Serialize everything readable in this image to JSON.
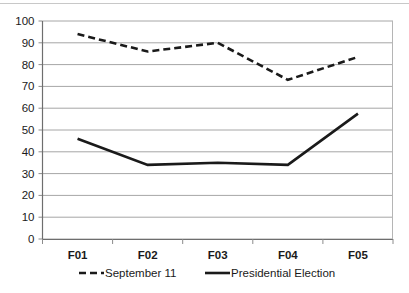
{
  "chart_data": {
    "type": "line",
    "title": "",
    "xlabel": "",
    "ylabel": "",
    "categories": [
      "F01",
      "F02",
      "F03",
      "F04",
      "F05"
    ],
    "ylim": [
      0,
      100
    ],
    "ytick_labels": [
      "0",
      "10",
      "20",
      "30",
      "40",
      "50",
      "60",
      "70",
      "80",
      "90",
      "100"
    ],
    "ytick_values": [
      0,
      10,
      20,
      30,
      40,
      50,
      60,
      70,
      80,
      90,
      100
    ],
    "grid": true,
    "legend_position": "bottom",
    "series": [
      {
        "name": "September 11",
        "style": "dashed",
        "color": "#1a1a1a",
        "values": [
          94,
          86,
          90,
          73,
          83.5
        ]
      },
      {
        "name": "Presidential Election",
        "style": "solid",
        "color": "#1a1a1a",
        "values": [
          46,
          34,
          35,
          34,
          57.5
        ]
      }
    ]
  },
  "legend": {
    "items": [
      {
        "label": "September 11",
        "marker": "dashed-line-marker"
      },
      {
        "label": "Presidential Election",
        "marker": "solid-line-marker"
      }
    ]
  },
  "axes": {
    "y_min_label": "0",
    "y_max_label": "100"
  }
}
